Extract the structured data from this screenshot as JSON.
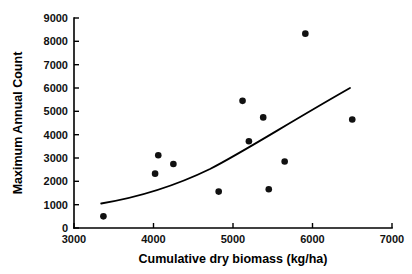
{
  "chart_data": {
    "type": "scatter",
    "title": "",
    "subtitle": "",
    "xlabel": "Cumulative dry biomass (kg/ha)",
    "ylabel": "Maximum Annual Count",
    "xlim": [
      3000,
      7000
    ],
    "ylim": [
      0,
      9000
    ],
    "xticks": [
      3000,
      4000,
      5000,
      6000,
      7000
    ],
    "xtick_labels": [
      "3000",
      "4000",
      "5000",
      "6000",
      "7000"
    ],
    "yticks": [
      0,
      1000,
      2000,
      3000,
      4000,
      5000,
      6000,
      7000,
      8000,
      9000
    ],
    "ytick_labels": [
      "0",
      "1000",
      "2000",
      "3000",
      "4000",
      "5000",
      "6000",
      "7000",
      "8000",
      "9000"
    ],
    "grid": false,
    "legend": "none",
    "marker": "filled-circle",
    "marker_color": "#111111",
    "points": [
      {
        "x": 3370,
        "y": 500
      },
      {
        "x": 4020,
        "y": 2330
      },
      {
        "x": 4060,
        "y": 3120
      },
      {
        "x": 4250,
        "y": 2740
      },
      {
        "x": 4820,
        "y": 1560
      },
      {
        "x": 5120,
        "y": 5450
      },
      {
        "x": 5200,
        "y": 3720
      },
      {
        "x": 5380,
        "y": 4740
      },
      {
        "x": 5450,
        "y": 1660
      },
      {
        "x": 5650,
        "y": 2850
      },
      {
        "x": 5910,
        "y": 8330
      },
      {
        "x": 6500,
        "y": 4650
      }
    ],
    "series": [
      {
        "name": "observations",
        "type": "scatter",
        "x": [
          3370,
          4020,
          4060,
          4250,
          4820,
          5120,
          5200,
          5380,
          5450,
          5650,
          5910,
          6500
        ],
        "values": [
          500,
          2330,
          3120,
          2740,
          1560,
          5450,
          3720,
          4740,
          1660,
          2850,
          8330,
          4650
        ]
      },
      {
        "name": "fitted-trend",
        "type": "line",
        "color": "#000000",
        "x": [
          3400,
          3700,
          4000,
          4300,
          4600,
          4900,
          5200,
          5500,
          5800,
          6100,
          6500
        ],
        "values": [
          1050,
          1250,
          1500,
          1800,
          2150,
          2570,
          3070,
          3650,
          4330,
          5100,
          6000
        ]
      }
    ]
  },
  "axes": {
    "x_title": "Cumulative dry biomass (kg/ha)",
    "y_title": "Maximum Annual Count"
  }
}
